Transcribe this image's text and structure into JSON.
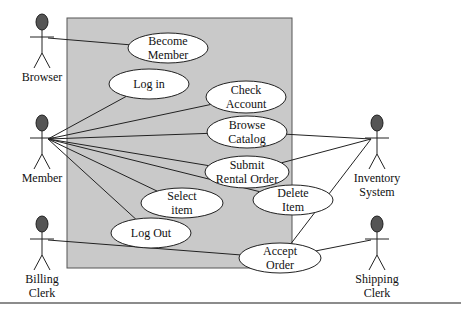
{
  "diagram": {
    "type": "uml-use-case",
    "system_boundary": {
      "x": 67,
      "y": 18,
      "w": 225,
      "h": 250,
      "fill": "#c9c9c9"
    },
    "actors": [
      {
        "id": "browser",
        "label": [
          "Browser"
        ],
        "x": 42,
        "y": 22
      },
      {
        "id": "member",
        "label": [
          "Member"
        ],
        "x": 42,
        "y": 123
      },
      {
        "id": "billing",
        "label": [
          "Billing",
          "Clerk"
        ],
        "x": 42,
        "y": 224
      },
      {
        "id": "inventory",
        "label": [
          "Inventory",
          "System"
        ],
        "x": 377,
        "y": 123
      },
      {
        "id": "shipping",
        "label": [
          "Shipping",
          "Clerk"
        ],
        "x": 377,
        "y": 224
      }
    ],
    "use_cases": [
      {
        "id": "become",
        "label": [
          "Become",
          "Member"
        ],
        "cx": 168,
        "cy": 48,
        "rx": 40,
        "ry": 15
      },
      {
        "id": "login",
        "label": [
          "Log in"
        ],
        "cx": 149,
        "cy": 84,
        "rx": 40,
        "ry": 15
      },
      {
        "id": "check",
        "label": [
          "Check",
          "Account"
        ],
        "cx": 246,
        "cy": 97,
        "rx": 40,
        "ry": 16
      },
      {
        "id": "browse",
        "label": [
          "Browse",
          "Catalog"
        ],
        "cx": 247,
        "cy": 132,
        "rx": 40,
        "ry": 16
      },
      {
        "id": "submit",
        "label": [
          "Submit",
          "Rental Order"
        ],
        "cx": 247,
        "cy": 172,
        "rx": 42,
        "ry": 16
      },
      {
        "id": "delete",
        "label": [
          "Delete",
          "Item"
        ],
        "cx": 293,
        "cy": 200,
        "rx": 40,
        "ry": 15
      },
      {
        "id": "select",
        "label": [
          "Select",
          "item"
        ],
        "cx": 182,
        "cy": 203,
        "rx": 41,
        "ry": 15
      },
      {
        "id": "logout",
        "label": [
          "Log Out"
        ],
        "cx": 151,
        "cy": 233,
        "rx": 40,
        "ry": 15
      },
      {
        "id": "accept",
        "label": [
          "Accept",
          "Order"
        ],
        "cx": 280,
        "cy": 258,
        "rx": 41,
        "ry": 15
      }
    ],
    "associations": [
      [
        "browser",
        "become"
      ],
      [
        "member",
        "login"
      ],
      [
        "member",
        "check"
      ],
      [
        "member",
        "browse"
      ],
      [
        "member",
        "submit"
      ],
      [
        "member",
        "delete"
      ],
      [
        "member",
        "select"
      ],
      [
        "member",
        "logout"
      ],
      [
        "billing",
        "accept"
      ],
      [
        "inventory",
        "browse"
      ],
      [
        "inventory",
        "submit"
      ],
      [
        "inventory",
        "accept"
      ],
      [
        "shipping",
        "accept"
      ]
    ]
  }
}
